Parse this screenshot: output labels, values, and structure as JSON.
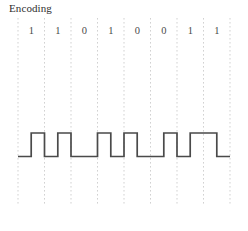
{
  "title": "Encoding",
  "chart_data": {
    "type": "line",
    "title": "Encoding",
    "xlabel": "",
    "ylabel": "",
    "subtype": "digital-waveform",
    "encoding_scheme": "manchester",
    "bits": [
      "1",
      "1",
      "0",
      "1",
      "0",
      "0",
      "1",
      "1"
    ],
    "bit_count": 8,
    "levels": [
      "low",
      "high"
    ],
    "ylim": [
      0,
      1
    ],
    "grid": true,
    "grid_style": "dotted",
    "grid_color": "#cccccc",
    "legend": "none",
    "signal_color": "#4a4a4a",
    "cell_boundaries_px": [
      18,
      44.5,
      71,
      97.5,
      124,
      150.5,
      177,
      203.5,
      230
    ],
    "waveform_segments": [
      {
        "bit": "1",
        "index": 0,
        "first_half": "low",
        "second_half": "high"
      },
      {
        "bit": "1",
        "index": 1,
        "first_half": "low",
        "second_half": "high"
      },
      {
        "bit": "0",
        "index": 2,
        "first_half": "low",
        "second_half": "high"
      },
      {
        "bit": "1",
        "index": 3,
        "first_half": "low",
        "second_half": "high"
      },
      {
        "bit": "0",
        "index": 4,
        "first_half": "low",
        "second_half": "high"
      },
      {
        "bit": "0",
        "index": 5,
        "first_half": "low",
        "second_half": "high"
      },
      {
        "bit": "1",
        "index": 6,
        "first_half": "low",
        "second_half": "high"
      },
      {
        "bit": "1",
        "index": 7,
        "first_half": "low",
        "second_half": "high"
      }
    ],
    "x": [
      18,
      31.2,
      31.2,
      44.5,
      44.5,
      57.8,
      57.8,
      71,
      71,
      97.5,
      97.5,
      110.8,
      110.8,
      124,
      124,
      137.2,
      137.2,
      163.8,
      163.8,
      177,
      177,
      190.2,
      190.2,
      216.8,
      216.8,
      230
    ],
    "y": [
      0,
      0,
      1,
      1,
      0,
      0,
      1,
      1,
      0,
      0,
      1,
      1,
      0,
      0,
      1,
      1,
      0,
      0,
      1,
      1,
      0,
      0,
      1,
      1,
      0,
      0
    ]
  }
}
